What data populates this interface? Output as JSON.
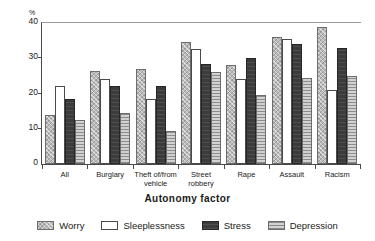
{
  "chart_data": {
    "type": "bar",
    "title": "",
    "xlabel": "Autonomy factor",
    "ylabel": "%",
    "ylim": [
      0,
      40
    ],
    "yticks": [
      0,
      10,
      20,
      30,
      40
    ],
    "grid": false,
    "legend_position": "bottom",
    "categories": [
      "All",
      "Burglary",
      "Theft of/from vehicle",
      "Street robbery",
      "Rape",
      "Assault",
      "Racism"
    ],
    "series": [
      {
        "name": "Worry",
        "color": "#b9b9b9",
        "values": [
          14.0,
          26.5,
          27.0,
          34.5,
          28.0,
          36.0,
          39.0
        ]
      },
      {
        "name": "Sleeplessness",
        "color": "#ffffff",
        "values": [
          22.0,
          24.0,
          18.5,
          32.5,
          24.0,
          35.5,
          21.0
        ]
      },
      {
        "name": "Stress",
        "color": "#3b3b3b",
        "values": [
          18.5,
          22.0,
          22.0,
          28.5,
          30.0,
          34.0,
          33.0
        ]
      },
      {
        "name": "Depression",
        "color": "#d2d2d2",
        "values": [
          12.5,
          14.5,
          9.5,
          26.0,
          19.5,
          24.5,
          25.0
        ]
      }
    ]
  },
  "axis": {
    "y_unit": "%",
    "x_title": "Autonomy factor"
  },
  "legend": {
    "items": [
      {
        "label": "Worry"
      },
      {
        "label": "Sleeplessness"
      },
      {
        "label": "Stress"
      },
      {
        "label": "Depression"
      }
    ]
  }
}
